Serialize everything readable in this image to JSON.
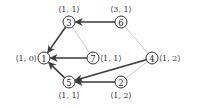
{
  "diagram": {
    "nodes": [
      {
        "id": "1",
        "label": "⟨1, 0⟩",
        "x": 44,
        "y": 58,
        "label_pos": "left"
      },
      {
        "id": "2",
        "label": "⟨1, 2⟩",
        "x": 121,
        "y": 82,
        "label_pos": "below"
      },
      {
        "id": "3",
        "label": "⟨1, 1⟩",
        "x": 69,
        "y": 22,
        "label_pos": "above"
      },
      {
        "id": "4",
        "label": "⟨1, 2⟩",
        "x": 152,
        "y": 58,
        "label_pos": "right"
      },
      {
        "id": "5",
        "label": "⟨1, 1⟩",
        "x": 69,
        "y": 82,
        "label_pos": "below"
      },
      {
        "id": "6",
        "label": "⟨3, 1⟩",
        "x": 121,
        "y": 22,
        "label_pos": "above"
      },
      {
        "id": "7",
        "label": "⟨1, 1⟩",
        "x": 93,
        "y": 58,
        "label_pos": "right"
      }
    ],
    "directed_edges": [
      {
        "from": "6",
        "to": "3"
      },
      {
        "from": "3",
        "to": "1"
      },
      {
        "from": "7",
        "to": "1"
      },
      {
        "from": "5",
        "to": "1"
      },
      {
        "from": "4",
        "to": "5"
      },
      {
        "from": "2",
        "to": "5"
      }
    ],
    "undirected_edges": [
      {
        "a": "3",
        "b": "7"
      },
      {
        "a": "6",
        "b": "4"
      },
      {
        "a": "4",
        "b": "2"
      }
    ],
    "colors": {
      "dark_edge": "#3a3a3a",
      "light_edge": "#c8c8c8",
      "node_stroke": "#333333"
    }
  }
}
